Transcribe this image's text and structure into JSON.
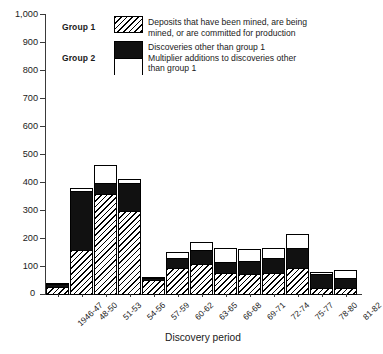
{
  "legend": {
    "group1": {
      "label": "Group 1",
      "swatch": "hatched-swatch",
      "text_line1": "Deposits that have been mined, are being",
      "text_line2": "mined, or are committed for production"
    },
    "group2": {
      "label": "Group 2",
      "swatch": "black-white-split-swatch",
      "text_line1": "Discoveries other than group 1",
      "text_line2": "Multiplier additions to discoveries other",
      "text_line3": "than group 1"
    }
  },
  "axes": {
    "x_title": "Discovery period",
    "y_zero_label": "0",
    "y_ticks": [
      "1,000",
      "900",
      "800",
      "700",
      "600",
      "500",
      "400",
      "300",
      "200",
      "100"
    ]
  },
  "chart_data": {
    "type": "bar",
    "title": "",
    "subtitle": "",
    "xlabel": "Discovery period",
    "ylabel": "",
    "ylim": [
      0,
      1000
    ],
    "ytick_values": [
      0,
      100,
      200,
      300,
      400,
      500,
      600,
      700,
      800,
      900,
      1000
    ],
    "grid": false,
    "stacked": true,
    "legend_position": "top-center",
    "categories": [
      "1946-47",
      "48-50",
      "51-53",
      "54-56",
      "57-59",
      "60-62",
      "63-65",
      "66-68",
      "69-71",
      "72-74",
      "75-77",
      "78-80",
      "81-82"
    ],
    "series": [
      {
        "name": "Deposits that have been mined, are being mined, or are committed for production",
        "group": "Group 1",
        "fill": "hatched",
        "values": [
          30,
          160,
          360,
          300,
          55,
          95,
          110,
          80,
          75,
          80,
          95,
          25,
          25
        ]
      },
      {
        "name": "Discoveries other than group 1",
        "group": "Group 2",
        "fill": "black",
        "values": [
          12,
          215,
          45,
          105,
          10,
          40,
          55,
          40,
          50,
          55,
          75,
          55,
          40
        ]
      },
      {
        "name": "Multiplier additions to discoveries other than group 1",
        "group": "Group 2",
        "fill": "white",
        "values": [
          8,
          15,
          65,
          15,
          5,
          25,
          30,
          55,
          45,
          40,
          55,
          10,
          30
        ]
      }
    ],
    "totals": [
      50,
      390,
      470,
      420,
      70,
      160,
      195,
      175,
      170,
      175,
      225,
      90,
      95
    ]
  }
}
